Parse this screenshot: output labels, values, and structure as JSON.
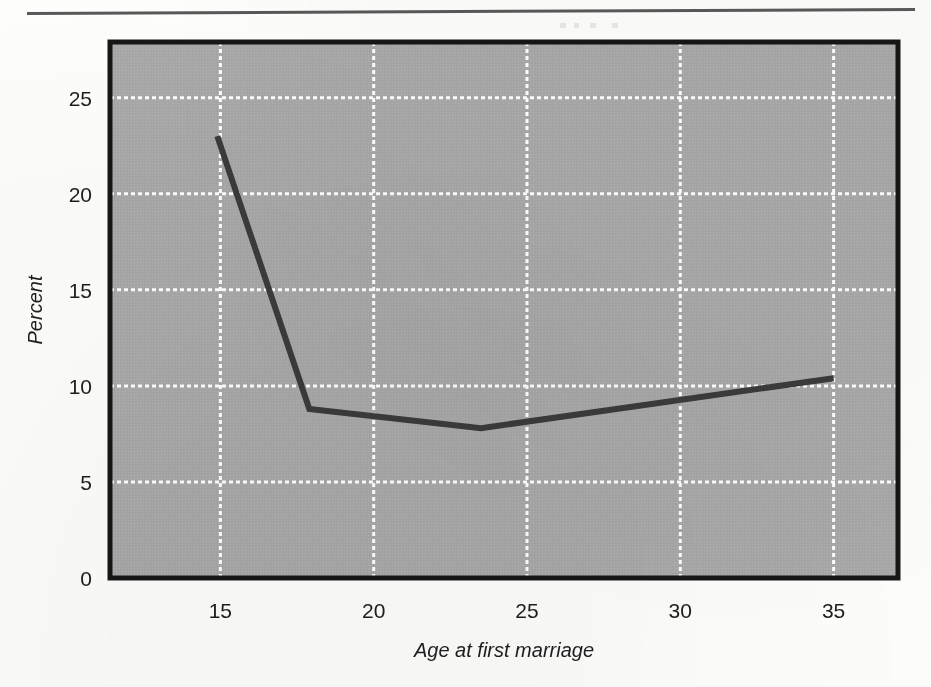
{
  "figure": {
    "background_color": "#a8a8a8",
    "line_color": "#3a3a3a",
    "gridline_color": "#ffffff",
    "border_color": "#141414",
    "top_rule": "page-rule"
  },
  "chart_data": {
    "type": "line",
    "title": "",
    "subtitle": "",
    "xlabel": "Age at first marriage",
    "ylabel": "Percent",
    "xlim": [
      11.4,
      37.1
    ],
    "ylim": [
      0,
      27.9
    ],
    "xticks": [
      15,
      20,
      25,
      30,
      35
    ],
    "xtick_labels": [
      "15",
      "20",
      "25",
      "30",
      "35"
    ],
    "yticks": [
      0,
      5,
      10,
      15,
      20,
      25
    ],
    "ytick_labels": [
      "0",
      "5",
      "10",
      "15",
      "20",
      "25"
    ],
    "grid": true,
    "grid_style": "dotted-white",
    "legend": "none",
    "series": [
      {
        "name": "Percent divorced by age at first marriage",
        "x": [
          14.9,
          17.9,
          23.5,
          35.0
        ],
        "y": [
          23.0,
          8.8,
          7.8,
          10.4
        ],
        "color": "#3a3a3a",
        "linewidth": 5,
        "markers": "none"
      }
    ],
    "annotations": []
  },
  "axis": {
    "y_title": "Percent",
    "x_title": "Age at first marriage"
  }
}
